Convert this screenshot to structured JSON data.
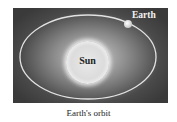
{
  "diagram": {
    "title": "Earth's orbit",
    "bodies": {
      "sun": "Sun",
      "earth": "Earth"
    },
    "colors": {
      "background": "#3a3a3a",
      "orbit": "#e0e0e0",
      "sun": "#e6e6e6"
    }
  }
}
